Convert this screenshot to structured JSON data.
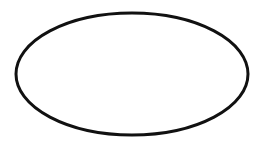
{
  "canvas": {
    "width": 266,
    "height": 150,
    "background": "#ffffff"
  },
  "shapes": [
    {
      "type": "ellipse",
      "cx": 132,
      "cy": 74,
      "rx": 116,
      "ry": 61,
      "stroke": "#111111",
      "stroke_width": 3,
      "fill": "none"
    }
  ]
}
